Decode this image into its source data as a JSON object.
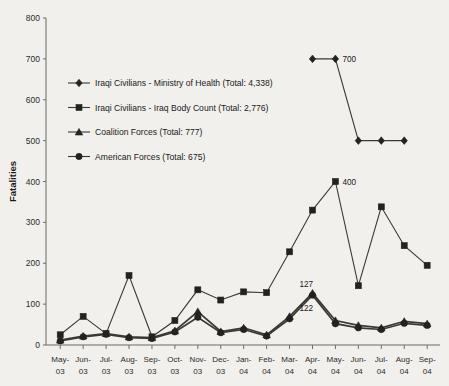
{
  "chart_data": {
    "type": "line",
    "title": "",
    "xlabel": "",
    "ylabel": "Fatalities",
    "ylim": [
      0,
      800
    ],
    "ytick_step": 100,
    "yticks": [
      0,
      100,
      200,
      300,
      400,
      500,
      600,
      700,
      800
    ],
    "grid": false,
    "legend_position": "inside-upper-left",
    "categories": [
      "May-03",
      "Jun-03",
      "Jul-03",
      "Aug-03",
      "Sep-03",
      "Oct-03",
      "Nov-03",
      "Dec-03",
      "Jan-04",
      "Feb-04",
      "Mar-04",
      "Apr-04",
      "May-04",
      "Jun-04",
      "Jul-04",
      "Aug-04",
      "Sep-04"
    ],
    "series": [
      {
        "name": "Iraqi Civilians - Ministry of Health (Total: 4,338)",
        "marker": "diamond",
        "total": "4,338",
        "values": [
          null,
          null,
          null,
          null,
          null,
          null,
          null,
          null,
          null,
          null,
          null,
          700,
          700,
          500,
          500,
          500,
          null
        ]
      },
      {
        "name": "Iraqi Civilians - Iraq Body Count (Total: 2,776)",
        "marker": "square",
        "total": "2,776",
        "values": [
          25,
          70,
          28,
          170,
          20,
          60,
          135,
          110,
          130,
          128,
          228,
          330,
          400,
          145,
          338,
          243,
          195
        ]
      },
      {
        "name": "Coalition Forces (Total: 777)",
        "marker": "triangle",
        "total": "777",
        "values": [
          12,
          22,
          28,
          20,
          18,
          35,
          82,
          33,
          42,
          25,
          70,
          127,
          60,
          48,
          42,
          58,
          52
        ]
      },
      {
        "name": "American Forces (Total: 675)",
        "marker": "circle",
        "total": "675",
        "values": [
          10,
          20,
          26,
          18,
          16,
          32,
          68,
          30,
          38,
          22,
          64,
          122,
          52,
          42,
          38,
          53,
          48
        ]
      }
    ],
    "annotations": [
      {
        "label": "700",
        "x": "May-04",
        "y": 700
      },
      {
        "label": "400",
        "x": "May-04",
        "y": 400
      },
      {
        "label": "127",
        "x": "Apr-04",
        "y": 127
      },
      {
        "label": "122",
        "x": "Apr-04",
        "y": 122
      }
    ]
  }
}
